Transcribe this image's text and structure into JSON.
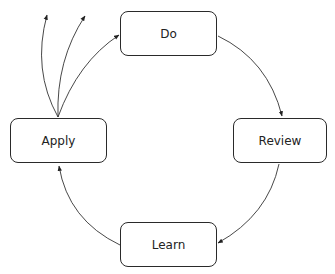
{
  "diagram": {
    "type": "cycle",
    "nodes": [
      {
        "id": "do",
        "label": "Do"
      },
      {
        "id": "review",
        "label": "Review"
      },
      {
        "id": "learn",
        "label": "Learn"
      },
      {
        "id": "apply",
        "label": "Apply"
      }
    ],
    "edges": [
      {
        "from": "do",
        "to": "review"
      },
      {
        "from": "review",
        "to": "learn"
      },
      {
        "from": "learn",
        "to": "apply"
      },
      {
        "from": "apply",
        "to": "do"
      },
      {
        "from": "apply",
        "to": "outward-1"
      },
      {
        "from": "apply",
        "to": "outward-2"
      }
    ]
  }
}
